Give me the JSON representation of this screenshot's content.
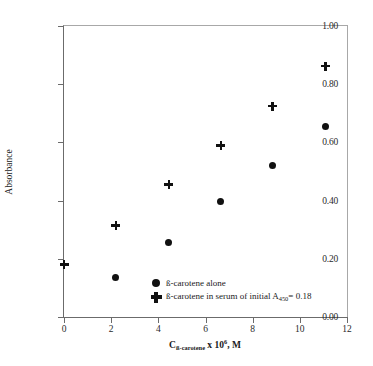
{
  "chart_data": {
    "type": "scatter",
    "title": "",
    "xlabel": "C_ß-carotene x 10^6, M",
    "ylabel": "Absorbance",
    "xlim": [
      0,
      12
    ],
    "ylim": [
      0.0,
      1.0
    ],
    "grid": false,
    "legend_position": "inside-bottom-center",
    "x_ticks": [
      "0",
      "2",
      "4",
      "6",
      "8",
      "10",
      "12"
    ],
    "x_tick_values": [
      0,
      2,
      4,
      6,
      8,
      10,
      12
    ],
    "y_ticks": [
      "0.00",
      "0.20",
      "0.40",
      "0.60",
      "0.80",
      "1.00"
    ],
    "y_tick_values": [
      0.0,
      0.2,
      0.4,
      0.6,
      0.8,
      1.0
    ],
    "series": [
      {
        "name": "ß-carotene alone",
        "marker": "filled-circle",
        "color": "#111111",
        "points": [
          {
            "x": 2.2,
            "y": 0.135
          },
          {
            "x": 4.45,
            "y": 0.255
          },
          {
            "x": 6.65,
            "y": 0.398
          },
          {
            "x": 8.85,
            "y": 0.52
          },
          {
            "x": 11.1,
            "y": 0.655
          }
        ]
      },
      {
        "name": "ß-carotene in serum of initial A450= 0.18",
        "marker": "plus",
        "color": "#111111",
        "points": [
          {
            "x": 0.0,
            "y": 0.18
          },
          {
            "x": 2.2,
            "y": 0.315
          },
          {
            "x": 4.45,
            "y": 0.455
          },
          {
            "x": 6.65,
            "y": 0.59
          },
          {
            "x": 8.85,
            "y": 0.725
          },
          {
            "x": 11.1,
            "y": 0.862
          }
        ]
      }
    ]
  },
  "axes": {
    "y_title": "Absorbance",
    "x_title": {
      "symbol": "C",
      "subscript": "ß-carotene",
      "middle": " x 10",
      "superscript": "6",
      "tail": ", M"
    }
  },
  "legend": {
    "entries": [
      {
        "marker": "filled-circle",
        "label": "ß-carotene alone",
        "label_prefix": "ß-carotene alone",
        "sub": "",
        "label_suffix": ""
      },
      {
        "marker": "plus",
        "label": "ß-carotene in serum of initial A450= 0.18",
        "label_prefix": "ß-carotene in serum of initial A",
        "sub": "450",
        "label_suffix": "= 0.18"
      }
    ]
  },
  "style": {
    "marker_color": "#111111",
    "axis_color": "#6b6b6b",
    "frame_color": "#a8a8a8",
    "background": "#ffffff"
  }
}
